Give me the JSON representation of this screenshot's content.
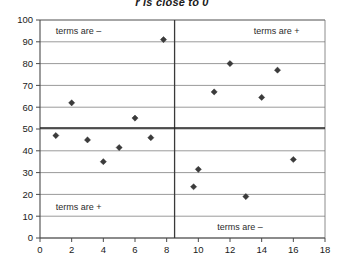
{
  "chart_data": {
    "type": "scatter",
    "title": "r is close to 0",
    "xlabel": "",
    "ylabel": "",
    "xlim": [
      0,
      18
    ],
    "ylim": [
      0,
      100
    ],
    "xticks": [
      0,
      2,
      4,
      6,
      8,
      10,
      12,
      14,
      16,
      18
    ],
    "yticks": [
      0,
      10,
      20,
      30,
      40,
      50,
      60,
      70,
      80,
      90,
      100
    ],
    "grid": true,
    "legend": "none",
    "x": [
      1,
      2,
      3,
      4,
      5,
      6,
      7,
      7.8,
      9.7,
      10,
      11,
      12,
      13,
      14,
      15,
      16
    ],
    "y": [
      47,
      62,
      45,
      35,
      41.5,
      55,
      46,
      91,
      23.5,
      31.5,
      67,
      80,
      19,
      64.5,
      77,
      36
    ],
    "points": [
      {
        "x": 1,
        "y": 47
      },
      {
        "x": 2,
        "y": 62
      },
      {
        "x": 3,
        "y": 45
      },
      {
        "x": 4,
        "y": 35
      },
      {
        "x": 5,
        "y": 41.5
      },
      {
        "x": 6,
        "y": 55
      },
      {
        "x": 7,
        "y": 46
      },
      {
        "x": 7.8,
        "y": 91
      },
      {
        "x": 9.7,
        "y": 23.5
      },
      {
        "x": 10,
        "y": 31.5
      },
      {
        "x": 11,
        "y": 67
      },
      {
        "x": 12,
        "y": 80
      },
      {
        "x": 13,
        "y": 19
      },
      {
        "x": 14,
        "y": 64.5
      },
      {
        "x": 15,
        "y": 77
      },
      {
        "x": 16,
        "y": 36
      }
    ],
    "reference_lines": [
      {
        "orientation": "vertical",
        "value": 8.5
      },
      {
        "orientation": "horizontal",
        "value": 50.5
      }
    ],
    "annotations": [
      {
        "id": "top-left",
        "text": "terms are –",
        "x": 1.0,
        "y": 95
      },
      {
        "id": "top-right",
        "text": "terms are +",
        "x": 13.5,
        "y": 95
      },
      {
        "id": "bottom-left",
        "text": "terms are +",
        "x": 1.0,
        "y": 14
      },
      {
        "id": "bottom-right",
        "text": "terms are –",
        "x": 11.2,
        "y": 5
      }
    ],
    "colors": {
      "point": "#3b3b3b",
      "grid": "#6e6e6e",
      "axis": "#4a4a4a",
      "divider": "#222222",
      "text": "#1a1a1a",
      "background": "#ffffff"
    }
  },
  "xtick_labels": [
    "0",
    "2",
    "4",
    "6",
    "8",
    "10",
    "12",
    "14",
    "16",
    "18"
  ],
  "ytick_labels": [
    "0",
    "10",
    "20",
    "30",
    "40",
    "50",
    "60",
    "70",
    "80",
    "90",
    "100"
  ],
  "quadrant_labels": {
    "top_left": "terms are –",
    "top_right": "terms are +",
    "bottom_left": "terms are +",
    "bottom_right": "terms are –"
  }
}
